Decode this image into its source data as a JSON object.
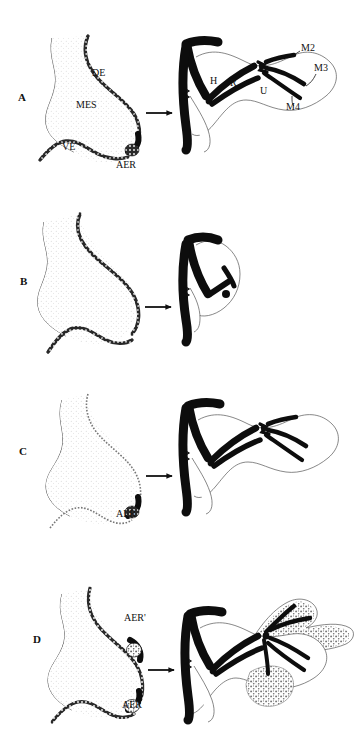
{
  "figure": {
    "background_color": "#ffffff",
    "ink_color": "#111111",
    "panel_count": 4
  },
  "panels": [
    {
      "id": "A",
      "letter": "A",
      "caption": "Normal limb bud with intact AER gives rise to a complete limb skeleton",
      "bud_labels": [
        {
          "key": "DE",
          "text": "DE",
          "meaning": "dorsal ectoderm"
        },
        {
          "key": "MES",
          "text": "MES",
          "meaning": "mesenchyme"
        },
        {
          "key": "VE",
          "text": "VE",
          "meaning": "ventral ectoderm"
        },
        {
          "key": "AER",
          "text": "AER",
          "meaning": "apical ectodermal ridge"
        }
      ],
      "skeleton_labels": [
        {
          "key": "H",
          "text": "H",
          "meaning": "humerus"
        },
        {
          "key": "R",
          "text": "R",
          "meaning": "radius"
        },
        {
          "key": "U",
          "text": "U",
          "meaning": "ulna"
        },
        {
          "key": "M2",
          "text": "M2",
          "meaning": "digit 2"
        },
        {
          "key": "M3",
          "text": "M3",
          "meaning": "digit 3"
        },
        {
          "key": "M4",
          "text": "M4",
          "meaning": "digit 4"
        }
      ],
      "arrow": "right-arrow"
    },
    {
      "id": "B",
      "letter": "B",
      "caption": "AER removed; limb bud ectoderm without ridge yields a truncated limb",
      "bud_labels": [],
      "skeleton_labels": [],
      "arrow": "right-arrow"
    },
    {
      "id": "C",
      "letter": "C",
      "caption": "AER grafted to the bud tip restores outgrowth of a normal limb",
      "bud_labels": [
        {
          "key": "AER",
          "text": "AER",
          "meaning": "apical ectodermal ridge"
        }
      ],
      "skeleton_labels": [],
      "arrow": "right-arrow"
    },
    {
      "id": "D",
      "letter": "D",
      "caption": "Second ectopic ridge AER' induces a duplicated distal limb",
      "bud_labels": [
        {
          "key": "AERp",
          "text": "AER'",
          "meaning": "ectopic grafted apical ectodermal ridge"
        },
        {
          "key": "AER",
          "text": "AER",
          "meaning": "apical ectodermal ridge"
        }
      ],
      "skeleton_labels": [],
      "arrow": "right-arrow"
    }
  ]
}
